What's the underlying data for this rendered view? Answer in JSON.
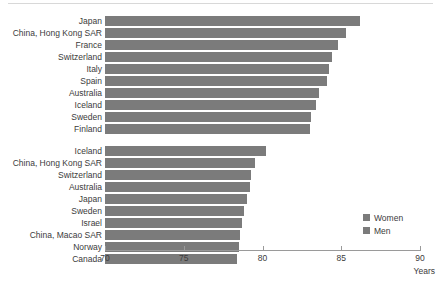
{
  "chart_data": {
    "type": "bar",
    "orientation": "horizontal",
    "title": "",
    "xlabel": "Years",
    "ylabel": "",
    "xlim": [
      70,
      90
    ],
    "xticks": [
      70,
      75,
      80,
      85,
      90
    ],
    "xtick_labels": [
      "70",
      "75",
      "80",
      "85",
      "90"
    ],
    "grid": false,
    "legend_position": "right-bottom",
    "bar_color": "#7b7b7b",
    "series": [
      {
        "name": "Women",
        "categories": [
          "Japan",
          "China, Hong Kong SAR",
          "France",
          "Switzerland",
          "Italy",
          "Spain",
          "Australia",
          "Iceland",
          "Sweden",
          "Finland"
        ],
        "values": [
          86.2,
          85.3,
          84.8,
          84.4,
          84.2,
          84.1,
          83.6,
          83.4,
          83.1,
          83.0
        ]
      },
      {
        "name": "Men",
        "categories": [
          "Iceland",
          "China, Hong Kong SAR",
          "Switzerland",
          "Australia",
          "Japan",
          "Sweden",
          "Israel",
          "China, Macao SAR",
          "Norway",
          "Canada"
        ],
        "values": [
          80.2,
          79.5,
          79.3,
          79.2,
          79.0,
          78.8,
          78.7,
          78.6,
          78.5,
          78.4
        ]
      }
    ],
    "legend": [
      "Women",
      "Men"
    ]
  },
  "axis": {
    "unit_label": "Years"
  },
  "legend": {
    "items": [
      {
        "label": "Women",
        "color": "#7b7b7b"
      },
      {
        "label": "Men",
        "color": "#7b7b7b"
      }
    ]
  }
}
